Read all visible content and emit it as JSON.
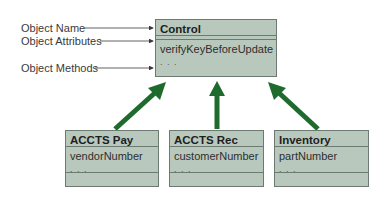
{
  "legend": {
    "object_name": "Object Name",
    "object_attributes": "Object Attributes",
    "object_methods": "Object Methods"
  },
  "parent": {
    "name": "Control",
    "method": "verifyKeyBeforeUpdate",
    "ellipsis": ". . ."
  },
  "children": [
    {
      "name": "ACCTS Pay",
      "attribute": "vendorNumber",
      "ellipsis": ". . ."
    },
    {
      "name": "ACCTS Rec",
      "attribute": "customerNumber",
      "ellipsis": ". . ."
    },
    {
      "name": "Inventory",
      "attribute": "partNumber",
      "ellipsis": ". . ."
    }
  ],
  "colors": {
    "box_fill": "#b9c8bd",
    "box_border": "#6d7a71",
    "arrow": "#1f6b2e",
    "pointer": "#3a3a3a"
  }
}
